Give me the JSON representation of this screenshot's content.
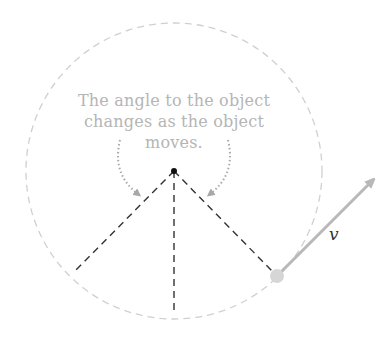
{
  "diagram": {
    "caption": "The angle to the object changes as the object moves.",
    "caption_lines": [
      "The angle to the object",
      "changes as the object",
      "moves."
    ],
    "velocity_label": "v",
    "elements": {
      "center": {
        "x": 174,
        "y": 171
      },
      "circle_radius": 148,
      "object": {
        "x": 277,
        "y": 276
      },
      "velocity_arrow_tip": {
        "x": 378,
        "y": 175
      },
      "radial_lines_endpoints": [
        {
          "x": 75,
          "y": 271
        },
        {
          "x": 174,
          "y": 312
        },
        {
          "x": 277,
          "y": 276
        }
      ]
    },
    "colors": {
      "circle": "#d0d0d0",
      "radial": "#333333",
      "arrow": "#b8b8b8",
      "object": "#d6d6d6",
      "caption": "#b5b5b5",
      "dotted_arrows": "#a8a8a8"
    }
  }
}
